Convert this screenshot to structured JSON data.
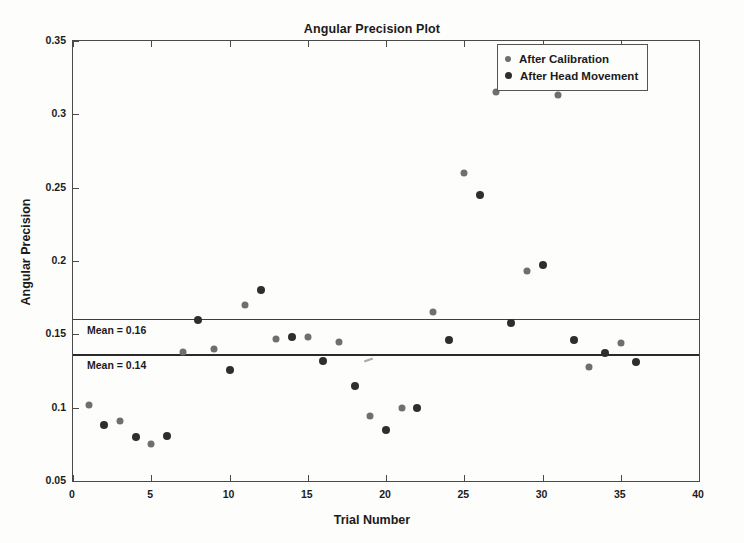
{
  "chart_data": {
    "type": "scatter",
    "title": "Angular Precision Plot",
    "xlabel": "Trial Number",
    "ylabel": "Angular Precision",
    "xlim": [
      0,
      40
    ],
    "ylim": [
      0.05,
      0.35
    ],
    "xticks": [
      0,
      5,
      10,
      15,
      20,
      25,
      30,
      35,
      40
    ],
    "xtick_labels": [
      "0",
      "5",
      "10",
      "15",
      "20",
      "25",
      "30",
      "35",
      "40"
    ],
    "yticks": [
      0.05,
      0.1,
      0.15,
      0.2,
      0.25,
      0.3,
      0.35
    ],
    "ytick_labels": [
      "0.05",
      "0.1",
      "0.15",
      "0.2",
      "0.25",
      "0.3",
      "0.35"
    ],
    "grid": false,
    "legend_position": "top-right",
    "legend_entries": [
      "After Calibration",
      "After Head Movement"
    ],
    "series": [
      {
        "name": "After Calibration",
        "color": "#6f6f6f",
        "points": [
          {
            "x": 1,
            "y": 0.102
          },
          {
            "x": 3,
            "y": 0.091
          },
          {
            "x": 5,
            "y": 0.075
          },
          {
            "x": 7,
            "y": 0.138
          },
          {
            "x": 9,
            "y": 0.14
          },
          {
            "x": 11,
            "y": 0.17
          },
          {
            "x": 13,
            "y": 0.147
          },
          {
            "x": 15,
            "y": 0.148
          },
          {
            "x": 17,
            "y": 0.145
          },
          {
            "x": 19,
            "y": 0.094
          },
          {
            "x": 21,
            "y": 0.1
          },
          {
            "x": 23,
            "y": 0.165
          },
          {
            "x": 25,
            "y": 0.26
          },
          {
            "x": 27,
            "y": 0.315
          },
          {
            "x": 29,
            "y": 0.193
          },
          {
            "x": 31,
            "y": 0.313
          },
          {
            "x": 33,
            "y": 0.128
          },
          {
            "x": 35,
            "y": 0.144
          }
        ]
      },
      {
        "name": "After Head Movement",
        "color": "#2e2e2e",
        "points": [
          {
            "x": 2,
            "y": 0.088
          },
          {
            "x": 4,
            "y": 0.08
          },
          {
            "x": 6,
            "y": 0.081
          },
          {
            "x": 8,
            "y": 0.16
          },
          {
            "x": 10,
            "y": 0.126
          },
          {
            "x": 12,
            "y": 0.18
          },
          {
            "x": 14,
            "y": 0.148
          },
          {
            "x": 16,
            "y": 0.132
          },
          {
            "x": 18,
            "y": 0.115
          },
          {
            "x": 20,
            "y": 0.085
          },
          {
            "x": 22,
            "y": 0.1
          },
          {
            "x": 24,
            "y": 0.146
          },
          {
            "x": 26,
            "y": 0.245
          },
          {
            "x": 28,
            "y": 0.158
          },
          {
            "x": 30,
            "y": 0.197
          },
          {
            "x": 32,
            "y": 0.146
          },
          {
            "x": 34,
            "y": 0.137
          },
          {
            "x": 36,
            "y": 0.131
          }
        ]
      }
    ],
    "reference_lines": [
      {
        "label": "Mean = 0.16",
        "value": 0.1605,
        "style": "thin",
        "series": "After Calibration"
      },
      {
        "label": "Mean = 0.14",
        "value": 0.1365,
        "style": "thick",
        "series": "After Head Movement"
      }
    ]
  }
}
